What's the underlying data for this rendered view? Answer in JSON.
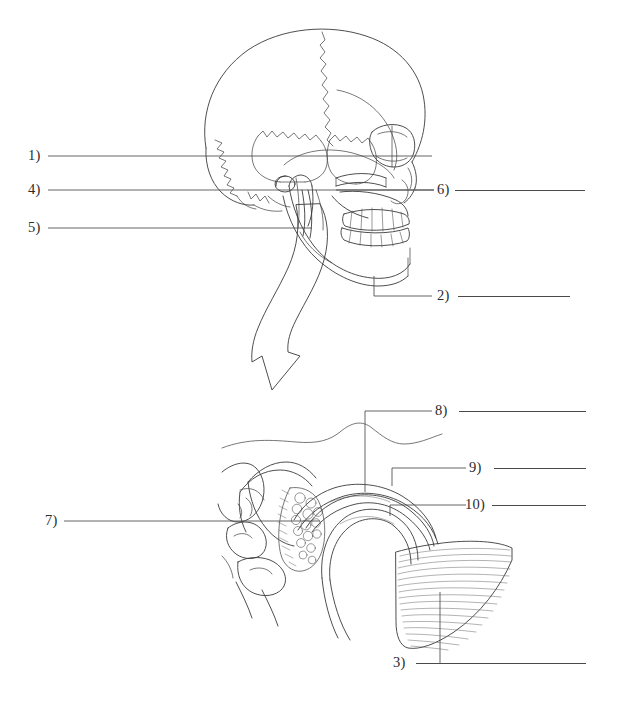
{
  "page": {
    "background_color": "#ffffff",
    "ink_color": "#3a3a3a",
    "line_color": "#4a4a4a",
    "width": 618,
    "height": 713
  },
  "figures": [
    {
      "name": "lateral-skull-view",
      "description": "Lateral view line drawing of a human skull showing cranial vault with coronal and lambdoid sutures, orbit, zygomatic arch, maxilla and mandible with full dentition, condyle and styloid process."
    },
    {
      "name": "tmj-detail-view",
      "description": "Magnified sagittal cross-section of the temporomandibular joint showing articular eminence, articular disc, joint spaces, retrodiscal tissue, mandibular condyle and lateral pterygoid muscle fibers."
    },
    {
      "name": "magnification-arrow",
      "description": "Large curved outline arrow pointing down and left from the skull view to the magnified TMJ detail."
    }
  ],
  "labels": [
    {
      "id": "1",
      "text": "1)",
      "blank_value": ""
    },
    {
      "id": "4",
      "text": "4)",
      "blank_value": ""
    },
    {
      "id": "5",
      "text": "5)",
      "blank_value": ""
    },
    {
      "id": "6",
      "text": "6)",
      "blank_value": ""
    },
    {
      "id": "2",
      "text": "2)",
      "blank_value": ""
    },
    {
      "id": "8",
      "text": "8)",
      "blank_value": ""
    },
    {
      "id": "9",
      "text": "9)",
      "blank_value": ""
    },
    {
      "id": "10",
      "text": "10)",
      "blank_value": ""
    },
    {
      "id": "7",
      "text": "7)",
      "blank_value": ""
    },
    {
      "id": "3",
      "text": "3)",
      "blank_value": ""
    }
  ]
}
